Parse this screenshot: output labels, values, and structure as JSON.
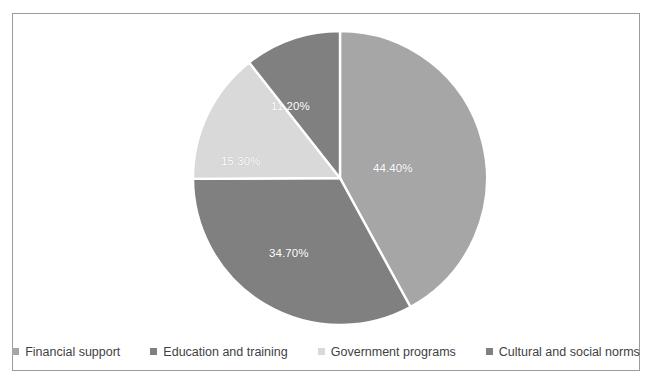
{
  "chart_data": {
    "type": "pie",
    "title": "",
    "subtitle": "",
    "xlabel": "",
    "ylabel": "",
    "grid": false,
    "legend_position": "bottom",
    "start_angle_deg": 0,
    "direction": "clockwise",
    "categories": [
      "Financial support",
      "Cultural and social norms",
      "Government programs",
      "Education and training"
    ],
    "values": [
      44.4,
      34.7,
      15.3,
      11.2
    ],
    "slices": [
      {
        "label": "Financial support",
        "value": 44.4,
        "data_label": "44.40%",
        "color": "#a6a6a6",
        "label_color": "#ffffff"
      },
      {
        "label": "Cultural and social norms",
        "value": 34.7,
        "data_label": "34.70%",
        "color": "#808080",
        "label_color": "#ffffff"
      },
      {
        "label": "Government programs",
        "value": 15.3,
        "data_label": "15.30%",
        "color": "#d9d9d9",
        "label_color": "#ffffff"
      },
      {
        "label": "Education and training",
        "value": 11.2,
        "data_label": "11.20%",
        "color": "#808080",
        "label_color": "#ffffff"
      }
    ]
  },
  "legend": {
    "items": [
      {
        "label": "Financial support",
        "color": "#a6a6a6"
      },
      {
        "label": "Education and training",
        "color": "#808080"
      },
      {
        "label": "Government programs",
        "color": "#d9d9d9"
      },
      {
        "label": "Cultural and social norms",
        "color": "#808080"
      }
    ]
  },
  "frame": {
    "border_color": "#9c9c9c",
    "background_color": "#ffffff",
    "slice_separator_color": "#ffffff"
  }
}
